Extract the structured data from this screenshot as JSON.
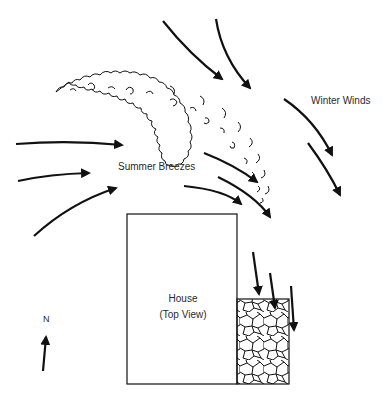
{
  "diagram": {
    "colors": {
      "ink": "#111111",
      "background": "#ffffff",
      "label": "#2a2a2a"
    },
    "labels": {
      "winter_winds": "Winter Winds",
      "summer_breezes": "Summer Breezes",
      "house_line1": "House",
      "house_line2": "(Top View)",
      "north": "N"
    },
    "elements": {
      "windbreak": "curved row of shrubs/trees (tree-line-icon)",
      "house": "rectangle, top view",
      "patio": "flagstone patio at southeast corner",
      "compass": "north arrow"
    },
    "arrow_groups": [
      {
        "name": "winter-winds",
        "direction": "from north/northwest toward southeast",
        "count": 4
      },
      {
        "name": "summer-breezes",
        "direction": "from west toward east",
        "count": 3
      },
      {
        "name": "deflected-breezes",
        "direction": "curving southeast toward house",
        "count": 2
      },
      {
        "name": "patio-downdraft",
        "direction": "southward onto patio",
        "count": 3
      }
    ]
  }
}
